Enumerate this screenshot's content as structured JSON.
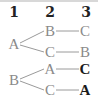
{
  "diagram": {
    "type": "tree",
    "levels": [
      "1",
      "2",
      "3"
    ],
    "trees": [
      {
        "root": "A",
        "branches": [
          {
            "level2": "B",
            "level3": "C",
            "level3_emphasis": false
          },
          {
            "level2": "C",
            "level3": "B",
            "level3_emphasis": false
          }
        ]
      },
      {
        "root": "B",
        "branches": [
          {
            "level2": "A",
            "level3": "C",
            "level3_emphasis": true
          },
          {
            "level2": "C",
            "level3": "A",
            "level3_emphasis": true
          }
        ]
      }
    ],
    "colors": {
      "node": "#8a8a8a",
      "emphasis": "#1a1a1a",
      "header": "#222222",
      "edge": "#9a9a9a"
    }
  }
}
